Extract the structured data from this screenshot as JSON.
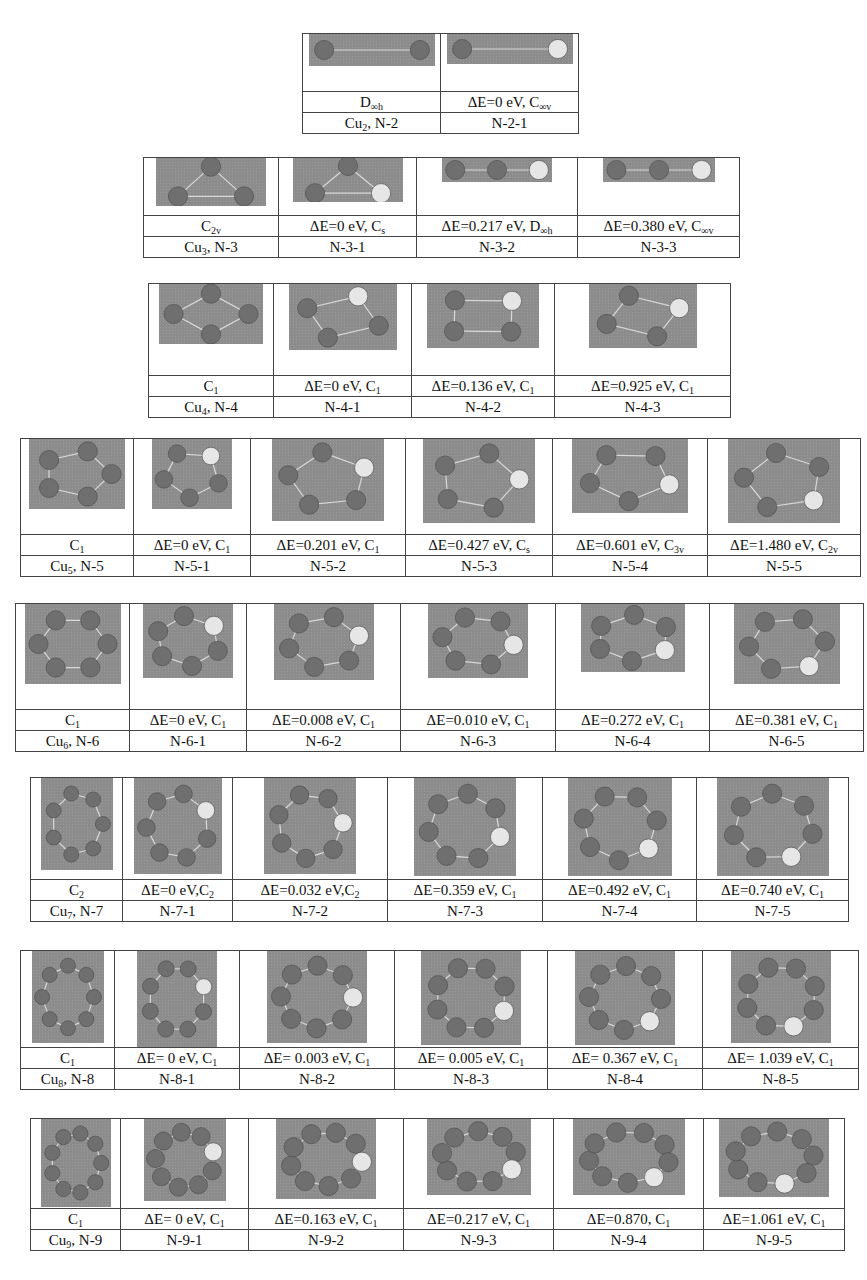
{
  "figure": {
    "blocks": [
      {
        "id": "cu2",
        "cells": [
          {
            "sym": "D",
            "sub": "∞h",
            "label_pre": "Cu",
            "label_sub": "2",
            "label_post": ", N-2"
          },
          {
            "sym_pre": "ΔE=0 eV, C",
            "sub": "∞v",
            "label": "N-2-1"
          }
        ]
      },
      {
        "id": "cu3",
        "cells": [
          {
            "sym": "C",
            "sub": "2v",
            "label_pre": "Cu",
            "label_sub": "3",
            "label_post": ", N-3"
          },
          {
            "sym_pre": "ΔE=0 eV, C",
            "sub": "s",
            "label": "N-3-1"
          },
          {
            "sym_pre": "ΔE=0.217 eV, D",
            "sub": "∞h",
            "label": "N-3-2"
          },
          {
            "sym_pre": "ΔE=0.380 eV, C",
            "sub": "∞v",
            "label": "N-3-3"
          }
        ]
      },
      {
        "id": "cu4",
        "cells": [
          {
            "sym": "C",
            "sub": "1",
            "label_pre": "Cu",
            "label_sub": "4",
            "label_post": ", N-4"
          },
          {
            "sym_pre": "ΔE=0 eV, C",
            "sub": "1",
            "label": "N-4-1"
          },
          {
            "sym_pre": "ΔE=0.136 eV, C",
            "sub": "1",
            "label": "N-4-2"
          },
          {
            "sym_pre": "ΔE=0.925 eV, C",
            "sub": "1",
            "label": "N-4-3"
          }
        ]
      },
      {
        "id": "cu5",
        "cells": [
          {
            "sym": "C",
            "sub": "1",
            "label_pre": "Cu",
            "label_sub": "5",
            "label_post": ", N-5"
          },
          {
            "sym_pre": "ΔE=0 eV, C",
            "sub": "1",
            "label": "N-5-1"
          },
          {
            "sym_pre": "ΔE=0.201 eV, C",
            "sub": "1",
            "label": "N-5-2"
          },
          {
            "sym_pre": "ΔE=0.427 eV, C",
            "sub": "s",
            "label": "N-5-3"
          },
          {
            "sym_pre": "ΔE=0.601 eV, C",
            "sub": "3v",
            "label": "N-5-4"
          },
          {
            "sym_pre": "ΔE=1.480 eV, C",
            "sub": "2v",
            "label": "N-5-5"
          }
        ]
      },
      {
        "id": "cu6",
        "cells": [
          {
            "sym": "C",
            "sub": "1",
            "label_pre": "Cu",
            "label_sub": "6",
            "label_post": ", N-6"
          },
          {
            "sym_pre": "ΔE=0 eV, C",
            "sub": "1",
            "label": "N-6-1"
          },
          {
            "sym_pre": "ΔE=0.008 eV, C",
            "sub": "1",
            "label": "N-6-2"
          },
          {
            "sym_pre": "ΔE=0.010 eV, C",
            "sub": "1",
            "label": "N-6-3"
          },
          {
            "sym_pre": "ΔE=0.272 eV, C",
            "sub": "1",
            "label": "N-6-4"
          },
          {
            "sym_pre": "ΔE=0.381 eV, C",
            "sub": "1",
            "label": "N-6-5"
          }
        ]
      },
      {
        "id": "cu7",
        "cells": [
          {
            "sym": "C",
            "sub": "2",
            "label_pre": "Cu",
            "label_sub": "7",
            "label_post": ", N-7"
          },
          {
            "sym_pre": "ΔE=0 eV,C",
            "sub": "2",
            "label": "N-7-1"
          },
          {
            "sym_pre": "ΔE=0.032 eV,C",
            "sub": "2",
            "label": "N-7-2"
          },
          {
            "sym_pre": "ΔE=0.359 eV, C",
            "sub": "1",
            "label": "N-7-3"
          },
          {
            "sym_pre": "ΔE=0.492 eV, C",
            "sub": "1",
            "label": "N-7-4"
          },
          {
            "sym_pre": "ΔE=0.740 eV, C",
            "sub": "1",
            "label": "N-7-5"
          }
        ]
      },
      {
        "id": "cu8",
        "cells": [
          {
            "sym": "C",
            "sub": "1",
            "label_pre": "Cu",
            "label_sub": "8",
            "label_post": ", N-8"
          },
          {
            "sym_pre": "ΔE= 0 eV, C",
            "sub": "1",
            "label": "N-8-1"
          },
          {
            "sym_pre": "ΔE= 0.003 eV, C",
            "sub": "1",
            "label": "N-8-2"
          },
          {
            "sym_pre": "ΔE= 0.005 eV, C",
            "sub": "1",
            "label": "N-8-3"
          },
          {
            "sym_pre": "ΔE= 0.367 eV, C",
            "sub": "1",
            "label": "N-8-4"
          },
          {
            "sym_pre": "ΔE= 1.039 eV, C",
            "sub": "1",
            "label": "N-8-5"
          }
        ]
      },
      {
        "id": "cu9",
        "cells": [
          {
            "sym": "C",
            "sub": "1",
            "label_pre": "Cu",
            "label_sub": "9",
            "label_post": ", N-9"
          },
          {
            "sym_pre": "ΔE= 0 eV,  C",
            "sub": "1",
            "label": "N-9-1"
          },
          {
            "sym_pre": "ΔE=0.163 eV, C",
            "sub": "1",
            "label": "N-9-2"
          },
          {
            "sym_pre": "ΔE=0.217 eV, C",
            "sub": "1",
            "label": "N-9-3"
          },
          {
            "sym_pre": "ΔE=0.870, C",
            "sub": "1",
            "label": "N-9-4"
          },
          {
            "sym_pre": "ΔE=1.061 eV, C",
            "sub": "1",
            "label": "N-9-5"
          }
        ]
      }
    ],
    "atom_labels": {
      "cu": "Cu",
      "au": "Au"
    },
    "colors": {
      "image_bg": "#8c8c8c",
      "cu_atom": "#6f6f6f",
      "au_atom": "#e6e6e6",
      "bond": "#d8d8d8",
      "border": "#444444"
    }
  }
}
